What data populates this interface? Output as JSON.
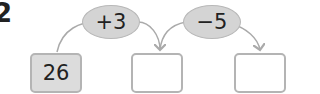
{
  "question_number": "2",
  "start_value": "26",
  "operations": [
    {
      "label": "+3"
    },
    {
      "label": "−5"
    }
  ],
  "answer_boxes": [
    {
      "value": ""
    },
    {
      "value": ""
    }
  ],
  "colors": {
    "box_border": "#b4b4b4",
    "filled_box": "#dcdcdc",
    "oval_fill": "#d4d4d4",
    "arrow": "#aaaaaa"
  }
}
